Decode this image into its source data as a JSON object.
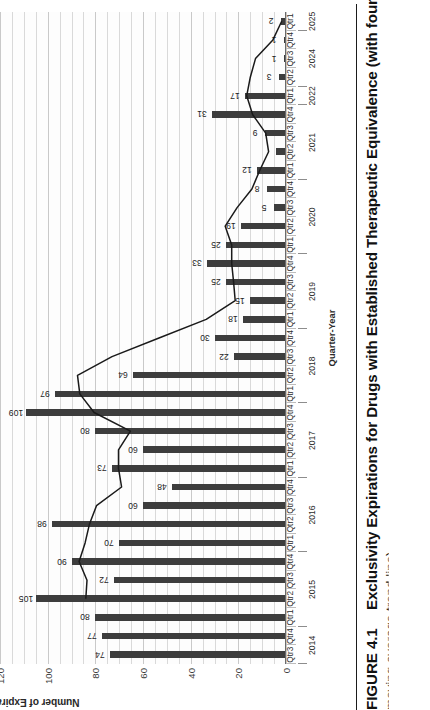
{
  "figure": {
    "caption_number": "FIGURE 4.1",
    "caption_text": "Exclusivity Expirations for Drugs with Established Therapeutic Equivalence (with four-quarter",
    "caption_line2": "moving average trend line)"
  },
  "chart_data": {
    "type": "bar",
    "title": "",
    "xlabel": "Quarter-Year",
    "ylabel": "Number of Expirations",
    "ylim": [
      0,
      120
    ],
    "yticks": [
      0,
      20,
      40,
      60,
      80,
      100,
      120
    ],
    "grid": true,
    "legend": "none",
    "orientation": "vertical",
    "categories": [
      "Qtr3 2014",
      "Qtr4 2014",
      "Qtr1 2015",
      "Qtr2 2015",
      "Qtr3 2015",
      "Qtr4 2015",
      "Qtr1 2016",
      "Qtr2 2016",
      "Qtr3 2016",
      "Qtr4 2016",
      "Qtr1 2017",
      "Qtr2 2017",
      "Qtr3 2017",
      "Qtr4 2017",
      "Qtr1 2018",
      "Qtr2 2018",
      "Qtr3 2018",
      "Qtr4 2018",
      "Qtr1 2019",
      "Qtr2 2019",
      "Qtr3 2019",
      "Qtr4 2019",
      "Qtr1 2020",
      "Qtr2 2020",
      "Qtr3 2020",
      "Qtr4 2020",
      "Qtr1 2021",
      "Qtr2 2021",
      "Qtr3 2021",
      "Qtr4 2021",
      "Qtr1 2022",
      "Qtr2 2024",
      "Qtr3 2024",
      "Qtr4 2024",
      "Qtr1 2025"
    ],
    "quarter_labels": [
      "Qtr3",
      "Qtr4",
      "Qtr1",
      "Qtr2",
      "Qtr3",
      "Qtr4",
      "Qtr1",
      "Qtr2",
      "Qtr3",
      "Qtr4",
      "Qtr1",
      "Qtr2",
      "Qtr3",
      "Qtr4",
      "Qtr1",
      "Qtr2",
      "Qtr3",
      "Qtr4",
      "Qtr1",
      "Qtr2",
      "Qtr3",
      "Qtr4",
      "Qtr1",
      "Qtr2",
      "Qtr3",
      "Qtr4",
      "Qtr1",
      "Qtr2",
      "Qtr3",
      "Qtr4",
      "Qtr1",
      "Qtr2",
      "Qtr3",
      "Qtr4",
      "Qtr1"
    ],
    "year_groups": [
      {
        "year": "2014",
        "start": 0,
        "count": 2
      },
      {
        "year": "2015",
        "start": 2,
        "count": 4
      },
      {
        "year": "2016",
        "start": 6,
        "count": 4
      },
      {
        "year": "2017",
        "start": 10,
        "count": 4
      },
      {
        "year": "2018",
        "start": 14,
        "count": 4
      },
      {
        "year": "2019",
        "start": 18,
        "count": 4
      },
      {
        "year": "2020",
        "start": 22,
        "count": 4
      },
      {
        "year": "2021",
        "start": 26,
        "count": 4
      },
      {
        "year": "2022",
        "start": 30,
        "count": 1
      },
      {
        "year": "2024",
        "start": 31,
        "count": 3
      },
      {
        "year": "2025",
        "start": 34,
        "count": 1
      }
    ],
    "values": [
      74,
      77,
      80,
      105,
      72,
      90,
      70,
      98,
      60,
      48,
      73,
      60,
      80,
      109,
      97,
      64,
      22,
      30,
      18,
      15,
      25,
      33,
      25,
      19,
      5,
      8,
      12,
      4,
      9,
      31,
      17,
      3,
      1,
      1,
      2
    ],
    "value_labels": [
      "74",
      "77",
      "80",
      "105",
      "72",
      "90",
      "70",
      "98",
      "60",
      "48",
      "73",
      "60",
      "80",
      "109",
      "97",
      "64",
      "22",
      "30",
      "18",
      "15",
      "25",
      "33",
      "25",
      "19",
      "5",
      "8",
      "12",
      "",
      "9",
      "31",
      "17",
      "3",
      "1",
      "1",
      "2"
    ],
    "series": [
      {
        "name": "Four-quarter moving average",
        "type": "line",
        "values": [
          null,
          null,
          null,
          84,
          83.5,
          86.8,
          84.3,
          82.5,
          79.5,
          69.0,
          70.3,
          70.3,
          65.3,
          80.5,
          86.5,
          87.5,
          73.0,
          53.3,
          33.5,
          21.3,
          22.0,
          22.8,
          22.8,
          25.5,
          20.5,
          14.3,
          11.0,
          7.3,
          8.5,
          14.0,
          16.5,
          15.0,
          12.8,
          5.5,
          1.8
        ]
      }
    ],
    "colors": {
      "bar": "#3d3d3d",
      "line": "#1a1a1a",
      "grid": "#d9d9d9",
      "axis": "#6a6a6a",
      "background": "#fdfdfd"
    }
  }
}
